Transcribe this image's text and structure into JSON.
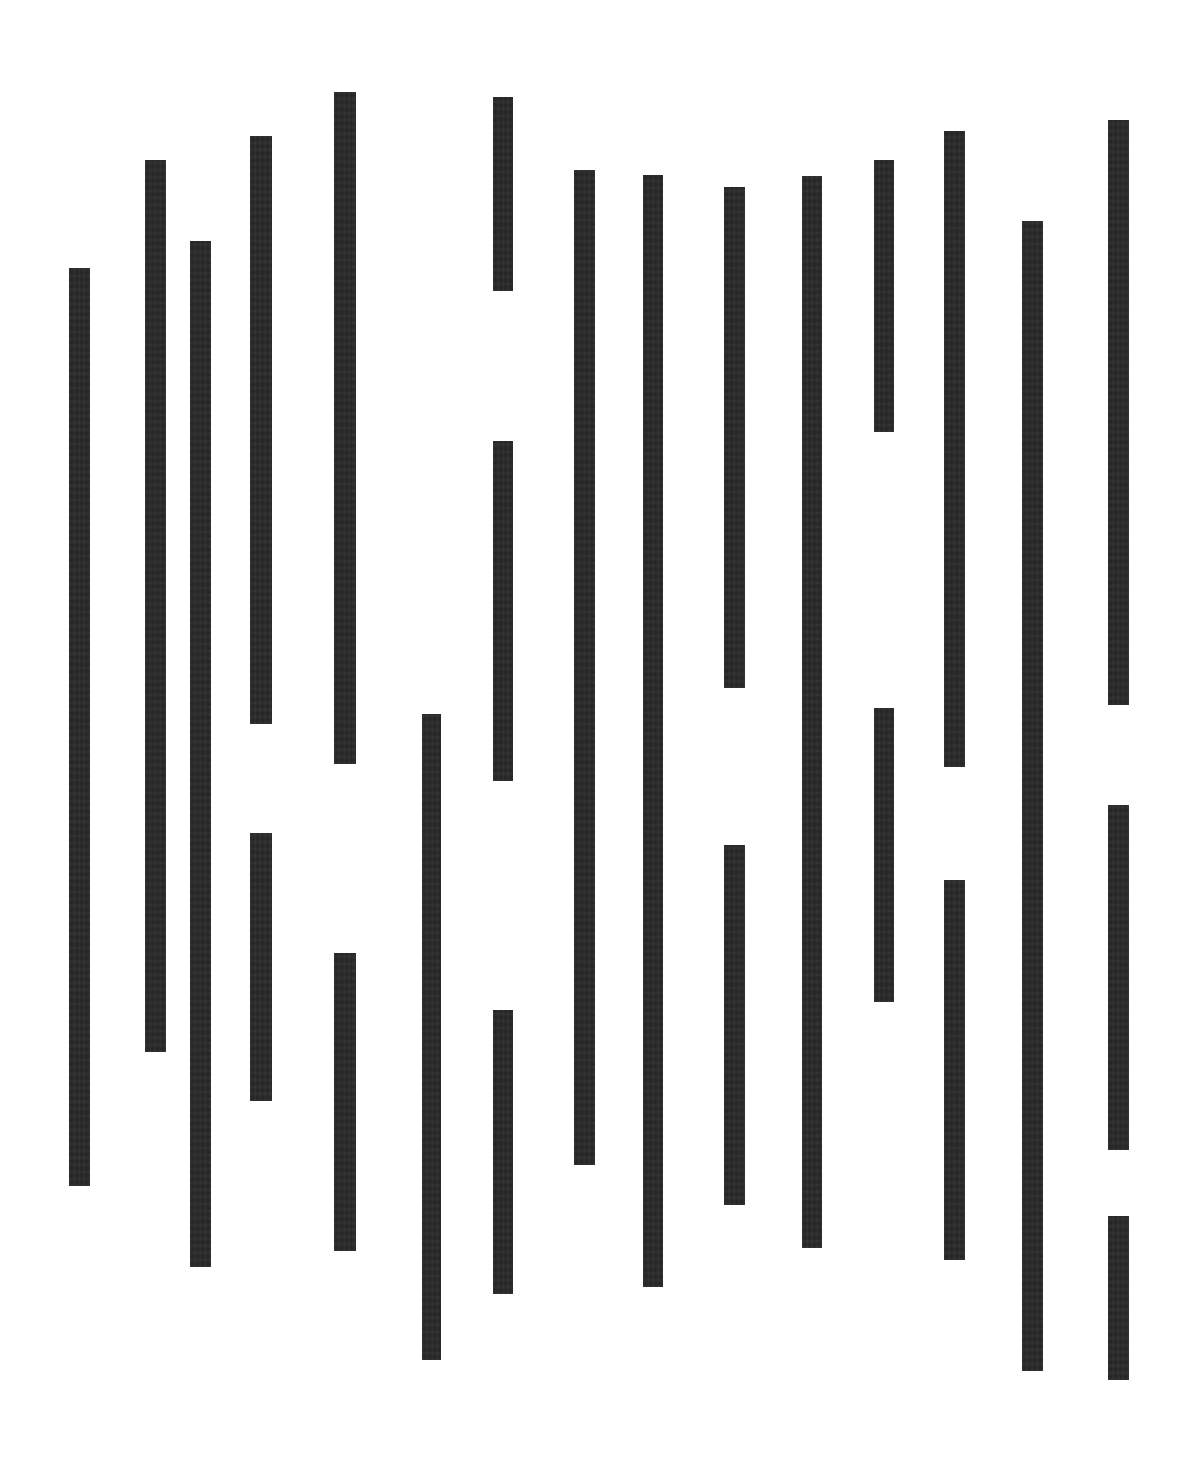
{
  "artwork": {
    "title": "Vertical Bars Composition",
    "background_color": "#ffffff",
    "bar_color": "#282828",
    "canvas_width": 1187,
    "canvas_height": 1461,
    "bar_count": 26
  },
  "chart_data": {
    "type": "bar",
    "xlabel": "",
    "ylabel": "",
    "grid": false,
    "legend": null,
    "orientation": "vertical",
    "note": "Abstract composition of vertical black bars of varying length and vertical offset on a white field. Each bar is described by its left edge x, top edge y, width and height in pixels.",
    "xlim": [
      0,
      1187
    ],
    "ylim": [
      0,
      1461
    ],
    "columns": [
      {
        "index": 1,
        "x": 69,
        "width": 21,
        "segments": [
          {
            "top": 268,
            "height": 918
          }
        ]
      },
      {
        "index": 2,
        "x": 145,
        "width": 21,
        "segments": [
          {
            "top": 160,
            "height": 892
          }
        ]
      },
      {
        "index": 3,
        "x": 190,
        "width": 21,
        "segments": [
          {
            "top": 241,
            "height": 1026
          }
        ]
      },
      {
        "index": 4,
        "x": 250,
        "width": 22,
        "segments": [
          {
            "top": 136,
            "height": 588
          },
          {
            "top": 833,
            "height": 268
          }
        ]
      },
      {
        "index": 5,
        "x": 334,
        "width": 22,
        "segments": [
          {
            "top": 92,
            "height": 672
          },
          {
            "top": 953,
            "height": 298
          }
        ]
      },
      {
        "index": 6,
        "x": 422,
        "width": 19,
        "segments": [
          {
            "top": 714,
            "height": 646
          }
        ]
      },
      {
        "index": 7,
        "x": 493,
        "width": 20,
        "segments": [
          {
            "top": 97,
            "height": 194
          },
          {
            "top": 441,
            "height": 340
          },
          {
            "top": 1010,
            "height": 284
          }
        ]
      },
      {
        "index": 8,
        "x": 574,
        "width": 21,
        "segments": [
          {
            "top": 170,
            "height": 995
          }
        ]
      },
      {
        "index": 9,
        "x": 643,
        "width": 20,
        "segments": [
          {
            "top": 175,
            "height": 1112
          }
        ]
      },
      {
        "index": 10,
        "x": 724,
        "width": 21,
        "segments": [
          {
            "top": 187,
            "height": 501
          },
          {
            "top": 845,
            "height": 360
          }
        ]
      },
      {
        "index": 11,
        "x": 802,
        "width": 20,
        "segments": [
          {
            "top": 176,
            "height": 1072
          }
        ]
      },
      {
        "index": 12,
        "x": 874,
        "width": 20,
        "segments": [
          {
            "top": 160,
            "height": 272
          },
          {
            "top": 708,
            "height": 294
          }
        ]
      },
      {
        "index": 13,
        "x": 944,
        "width": 21,
        "segments": [
          {
            "top": 131,
            "height": 636
          },
          {
            "top": 880,
            "height": 380
          }
        ]
      },
      {
        "index": 14,
        "x": 1022,
        "width": 21,
        "segments": [
          {
            "top": 221,
            "height": 1150
          }
        ]
      },
      {
        "index": 15,
        "x": 1108,
        "width": 21,
        "segments": [
          {
            "top": 120,
            "height": 585
          },
          {
            "top": 805,
            "height": 345
          },
          {
            "top": 1216,
            "height": 164
          }
        ]
      }
    ]
  }
}
